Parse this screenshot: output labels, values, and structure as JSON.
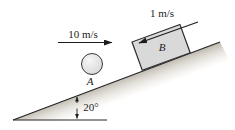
{
  "figure": {
    "angle_label": "20°",
    "angle_value_deg": 20,
    "ball": {
      "label": "A",
      "velocity_label": "10 m/s"
    },
    "block": {
      "label": "B",
      "velocity_label": "1 m/s"
    },
    "colors": {
      "ink": "#1c1c1c",
      "background": "#ffffff",
      "block_fill": "#d9d9d9",
      "block_border": "#2f2f2f",
      "ball_fill_light": "#f6f6f6",
      "ball_fill_dark": "#c6c6c6",
      "incline_shade": "#b5afa3"
    }
  }
}
